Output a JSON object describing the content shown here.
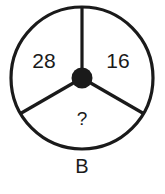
{
  "figure": {
    "type": "segmented-circle-puzzle",
    "label": "B",
    "colors": {
      "stroke": "#1a1a1a",
      "background": "#ffffff",
      "hub": "#1a1a1a"
    },
    "circle": {
      "center_x": 82,
      "center_y": 78,
      "radius": 71,
      "stroke_width": 3.2,
      "hub_radius": 10.5
    },
    "spokes": [
      {
        "name": "spoke-top",
        "angle_deg": 90
      },
      {
        "name": "spoke-lower-left",
        "angle_deg": 210
      },
      {
        "name": "spoke-lower-right",
        "angle_deg": 330
      }
    ],
    "sectors": [
      {
        "name": "left-sector",
        "value": "28",
        "position": "left",
        "text_x": 44,
        "text_y": 62
      },
      {
        "name": "right-sector",
        "value": "16",
        "position": "right",
        "text_x": 118,
        "text_y": 62
      },
      {
        "name": "bottom-sector",
        "value": "?",
        "position": "bottom",
        "text_x": 82,
        "text_y": 120
      }
    ],
    "label_position": {
      "x": 82,
      "y": 168
    }
  }
}
